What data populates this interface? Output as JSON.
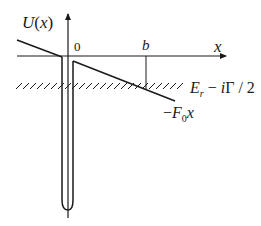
{
  "diagram": {
    "type": "potential-energy-diagram",
    "labels": {
      "y_axis": "U(x)",
      "y_axis_func": "U",
      "y_axis_open": "(",
      "y_axis_var": "x",
      "y_axis_close": ")",
      "origin": "0",
      "point_b": "b",
      "x_axis": "x",
      "energy_E": "E",
      "energy_sub": "r",
      "energy_rest_minus": " − ",
      "energy_i": "i",
      "energy_gamma": "Γ / 2",
      "energy_full": "E_r − iΓ/2",
      "field_minus": "−",
      "field_F": "F",
      "field_sub": "0",
      "field_x": "x",
      "field_full": "−F₀x"
    },
    "elements": [
      "vertical-axis-U",
      "horizontal-axis-x",
      "left-linear-potential",
      "deep-narrow-well",
      "right-linear-potential-minus-F0x",
      "turning-point-marker-b",
      "hatched-resonance-energy-level"
    ],
    "colors": {
      "stroke": "#1a1a1a",
      "background": "#ffffff"
    }
  }
}
